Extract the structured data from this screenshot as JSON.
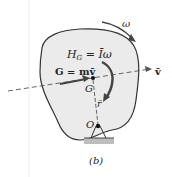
{
  "diagram": {
    "caption": "(b)",
    "labels": {
      "omega": "ω",
      "angular_momentum": "H",
      "angular_momentum_sub": "G",
      "angular_momentum_eq": " = Īω",
      "linear_momentum": "G = mv̄",
      "center_of_mass": "G",
      "position": "r̄",
      "pivot": "O",
      "velocity": "v̄"
    },
    "colors": {
      "body_fill": "#ebebeb",
      "body_stroke": "#333333",
      "arrow": "#444444",
      "ground": "#b5b5b5"
    }
  }
}
